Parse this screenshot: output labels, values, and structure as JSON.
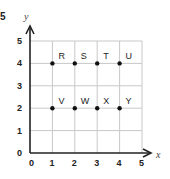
{
  "question_number": "5",
  "chart_data": {
    "type": "scatter",
    "title": "",
    "xlabel": "x",
    "ylabel": "y",
    "xlim": [
      0,
      5
    ],
    "ylim": [
      0,
      5
    ],
    "grid": true,
    "x_ticks": [
      "0",
      "1",
      "2",
      "3",
      "4",
      "5"
    ],
    "y_ticks": [
      "0",
      "1",
      "2",
      "3",
      "4",
      "5"
    ],
    "points": [
      {
        "label": "R",
        "x": 1,
        "y": 4
      },
      {
        "label": "S",
        "x": 2,
        "y": 4
      },
      {
        "label": "T",
        "x": 3,
        "y": 4
      },
      {
        "label": "U",
        "x": 4,
        "y": 4
      },
      {
        "label": "V",
        "x": 1,
        "y": 2
      },
      {
        "label": "W",
        "x": 2,
        "y": 2
      },
      {
        "label": "X",
        "x": 3,
        "y": 2
      },
      {
        "label": "Y",
        "x": 4,
        "y": 2
      }
    ]
  },
  "colors": {
    "grid": "#c8c8c8",
    "axis": "#222222",
    "point": "#111111"
  }
}
